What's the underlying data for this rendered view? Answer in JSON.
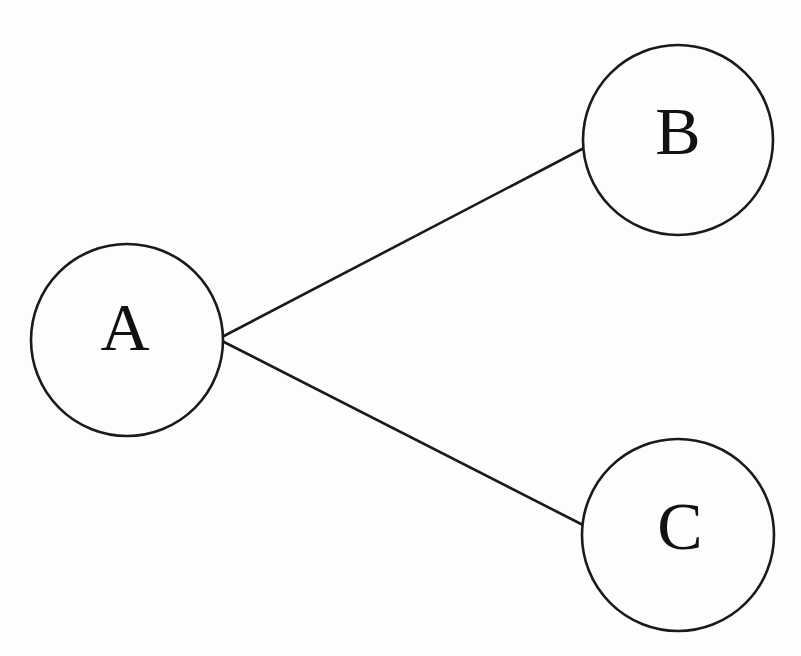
{
  "diagram": {
    "background_color": "#fdfdfd",
    "stroke_color": "#1a1a1a",
    "label_color": "#111111",
    "stroke_width": 2.6,
    "canvas": {
      "width": 801,
      "height": 656
    },
    "nodes": [
      {
        "id": "A",
        "label": "A",
        "cx": 127,
        "cy": 340,
        "r": 96,
        "label_x": 125,
        "label_y": 334
      },
      {
        "id": "B",
        "label": "B",
        "cx": 678,
        "cy": 140,
        "r": 95,
        "label_x": 678,
        "label_y": 138
      },
      {
        "id": "C",
        "label": "C",
        "cx": 678,
        "cy": 535,
        "r": 96,
        "label_x": 680,
        "label_y": 533
      }
    ],
    "edges": [
      {
        "id": "A-B",
        "from": "A",
        "to": "B",
        "x1": 222,
        "y1": 337,
        "x2": 584,
        "y2": 148,
        "directed": false
      },
      {
        "id": "A-C",
        "from": "A",
        "to": "C",
        "x1": 222,
        "y1": 341,
        "x2": 583,
        "y2": 525,
        "directed": false
      }
    ]
  }
}
